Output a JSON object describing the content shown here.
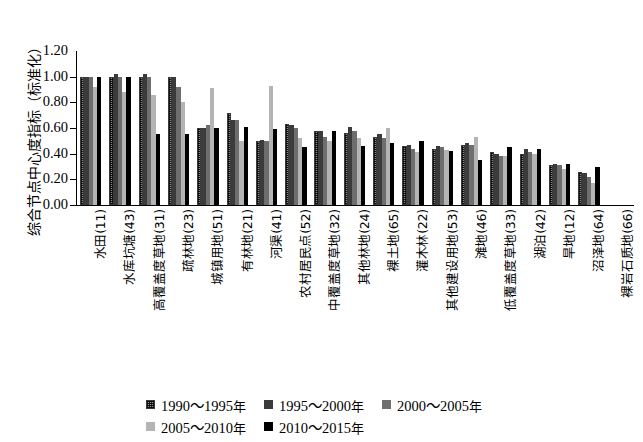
{
  "chart_data": {
    "type": "bar",
    "title": "",
    "xlabel": "",
    "ylabel": "综合节点中心度指标（标准化）",
    "ylim": [
      0.0,
      1.2
    ],
    "ytick_labels": [
      "1.20",
      "1.00",
      "0.80",
      "0.60",
      "0.40",
      "0.20",
      "0.00"
    ],
    "ytick_values": [
      1.2,
      1.0,
      0.8,
      0.6,
      0.4,
      0.2,
      0.0
    ],
    "grid": false,
    "legend_position": "bottom",
    "categories": [
      "水田(11)",
      "水库坑塘(43)",
      "高覆盖度草地(31)",
      "疏林地(23)",
      "城镇用地(51)",
      "有林地(21)",
      "河渠(41)",
      "农村居民点(52)",
      "中覆盖度草地(32)",
      "其他林地(24)",
      "裸土地(65)",
      "灌木林(22)",
      "其他建设用地(53)",
      "滩地(46)",
      "低覆盖度草地(33)",
      "湖泊(42)",
      "旱地(12)",
      "沼泽地(64)",
      "裸岩石质地(66)"
    ],
    "series": [
      {
        "name": "1990～1995年",
        "color": "#8b8b8b",
        "pattern": "cross-hatch",
        "values": [
          1.0,
          1.0,
          1.0,
          1.0,
          0.6,
          0.72,
          0.5,
          0.63,
          0.58,
          0.56,
          0.53,
          0.46,
          0.44,
          0.47,
          0.41,
          0.4,
          0.31,
          0.26,
          0.0
        ]
      },
      {
        "name": "1995～2000年",
        "color": "#3b3b3b",
        "pattern": "solid",
        "values": [
          1.0,
          1.02,
          1.02,
          1.0,
          0.6,
          0.66,
          0.51,
          0.62,
          0.58,
          0.61,
          0.55,
          0.47,
          0.46,
          0.48,
          0.4,
          0.44,
          0.32,
          0.25,
          0.0
        ]
      },
      {
        "name": "2000～2005年",
        "color": "#6e6e6e",
        "pattern": "solid",
        "values": [
          1.0,
          1.0,
          1.0,
          0.92,
          0.62,
          0.66,
          0.5,
          0.6,
          0.53,
          0.58,
          0.52,
          0.44,
          0.45,
          0.47,
          0.38,
          0.41,
          0.31,
          0.22,
          0.0
        ]
      },
      {
        "name": "2005～2010年",
        "color": "#b4b4b4",
        "pattern": "solid",
        "values": [
          0.92,
          0.88,
          0.86,
          0.8,
          0.91,
          0.5,
          0.93,
          0.52,
          0.5,
          0.52,
          0.6,
          0.41,
          0.43,
          0.53,
          0.38,
          0.4,
          0.28,
          0.17,
          0.0
        ]
      },
      {
        "name": "2010～2015年",
        "color": "#000000",
        "pattern": "solid",
        "values": [
          1.0,
          1.0,
          0.55,
          0.55,
          0.6,
          0.61,
          0.59,
          0.45,
          0.58,
          0.46,
          0.48,
          0.5,
          0.42,
          0.35,
          0.45,
          0.44,
          0.32,
          0.3,
          0.0
        ]
      }
    ]
  }
}
